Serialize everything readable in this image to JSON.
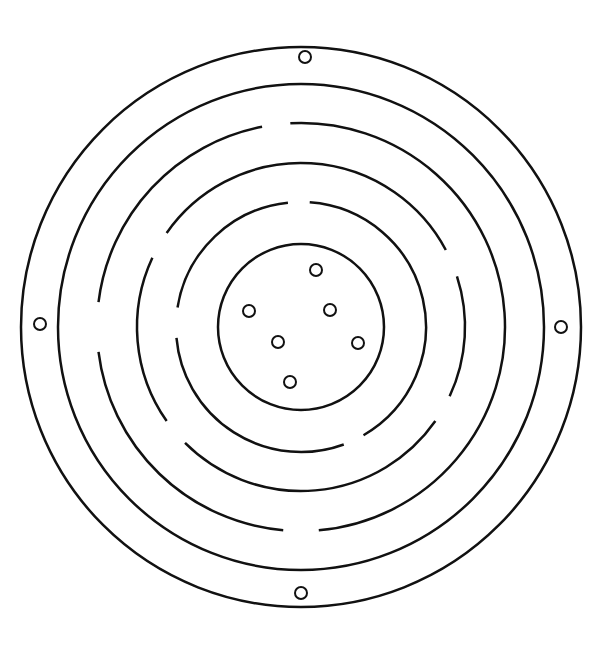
{
  "diagram": {
    "title": "",
    "stroke_color": "#111111",
    "background": "#ffffff",
    "center": [
      301,
      327
    ],
    "rings": [
      {
        "r": 280,
        "gaps": []
      },
      {
        "r": 243,
        "gaps": []
      },
      {
        "r": 204,
        "gaps": [
          [
            -101,
            -93
          ],
          [
            173,
            187
          ],
          [
            85,
            95
          ]
        ]
      },
      {
        "r": 164,
        "gaps": [
          [
            -28,
            -18
          ],
          [
            205,
            215
          ],
          [
            25,
            35
          ],
          [
            135,
            145
          ]
        ]
      },
      {
        "r": 125,
        "gaps": [
          [
            -96,
            -86
          ],
          [
            175,
            189
          ],
          [
            60,
            70
          ]
        ]
      },
      {
        "r": 83,
        "gaps": []
      }
    ],
    "outer_holes": [
      [
        305,
        57
      ],
      [
        40,
        324
      ],
      [
        561,
        327
      ],
      [
        301,
        593
      ]
    ],
    "inner_holes": [
      [
        316,
        270
      ],
      [
        249,
        311
      ],
      [
        330,
        310
      ],
      [
        278,
        342
      ],
      [
        358,
        343
      ],
      [
        290,
        382
      ]
    ]
  }
}
